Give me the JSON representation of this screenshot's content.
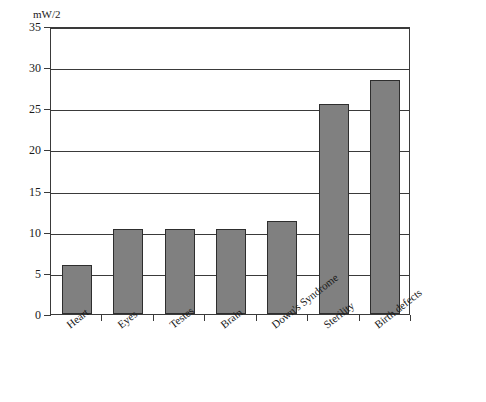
{
  "chart_data": {
    "type": "bar",
    "title": "",
    "xlabel": "",
    "ylabel": "mW/2",
    "ylim": [
      0,
      35
    ],
    "yticks": [
      0,
      5,
      10,
      15,
      20,
      25,
      30,
      35
    ],
    "grid": true,
    "legend": "none",
    "bar_color": "#808080",
    "bar_edge_color": "#2e2e2e",
    "axis_color": "#3a3a3a",
    "categories": [
      "Heart",
      "Eyes",
      "Testes",
      "Brain",
      "Down's Syndrome",
      "Sterility",
      "Birth defects"
    ],
    "values": [
      6.0,
      10.3,
      10.3,
      10.3,
      11.3,
      25.5,
      28.5
    ]
  }
}
